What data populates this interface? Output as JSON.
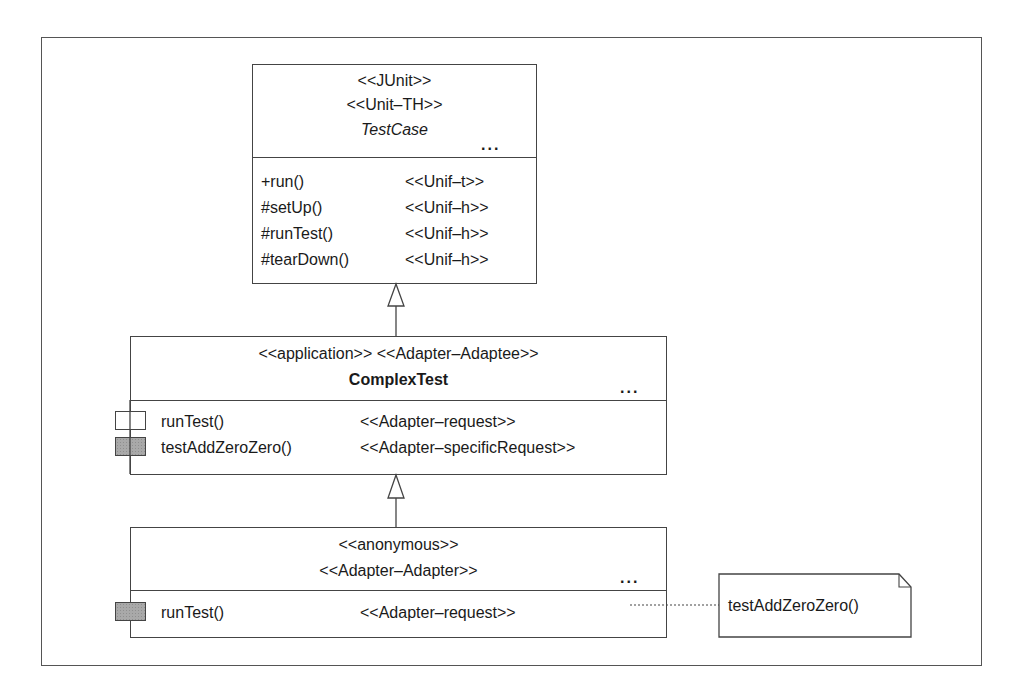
{
  "diagram": {
    "type": "UML class diagram",
    "classes": {
      "testcase": {
        "stereotypes": [
          "<<JUnit>>",
          "<<Unit–TH>>"
        ],
        "name": "TestCase",
        "name_style": "italic",
        "ellipsis": "...",
        "operations": [
          {
            "signature": "+run()",
            "stereotype": "<<Unif–t>>"
          },
          {
            "signature": "#setUp()",
            "stereotype": "<<Unif–h>>"
          },
          {
            "signature": "#runTest()",
            "stereotype": "<<Unif–h>>"
          },
          {
            "signature": "#tearDown()",
            "stereotype": "<<Unif–h>>"
          }
        ]
      },
      "complextest": {
        "stereotype_line": "<<application>> <<Adapter–Adaptee>>",
        "name": "ComplexTest",
        "name_style": "bold",
        "ellipsis": "...",
        "operations": [
          {
            "signature": "runTest()",
            "stereotype": "<<Adapter–request>>",
            "marker": "empty-box"
          },
          {
            "signature": "testAddZeroZero()",
            "stereotype": "<<Adapter–specificRequest>>",
            "marker": "shaded-box"
          }
        ]
      },
      "anonymous": {
        "stereotypes": [
          "<<anonymous>>",
          "<<Adapter–Adapter>>"
        ],
        "ellipsis": "...",
        "operations": [
          {
            "signature": "runTest()",
            "stereotype": "<<Adapter–request>>",
            "marker": "shaded-box"
          }
        ]
      }
    },
    "relations": [
      {
        "type": "generalization",
        "from": "complextest",
        "to": "testcase"
      },
      {
        "type": "generalization",
        "from": "anonymous",
        "to": "complextest"
      },
      {
        "type": "note-attachment",
        "from": "anonymous.runTest",
        "to": "note"
      }
    ],
    "note": {
      "text": "testAddZeroZero()"
    },
    "colors": {
      "line": "#444444",
      "shaded_marker": "#a9a9a9",
      "background": "#ffffff"
    }
  }
}
